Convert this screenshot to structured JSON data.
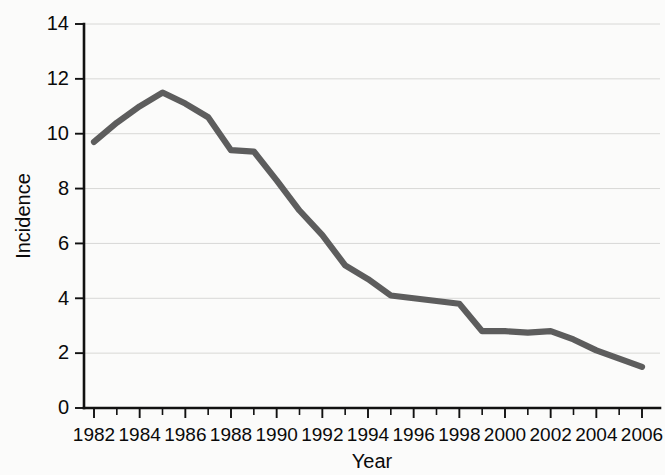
{
  "chart_data": {
    "type": "line",
    "title": "",
    "subtitle": "",
    "xlabel": "Year",
    "ylabel": "Incidence",
    "xlim": [
      1982,
      2006
    ],
    "ylim": [
      0,
      14
    ],
    "grid": true,
    "legend": "none",
    "x_tick_labels": [
      "1982",
      "1984",
      "1986",
      "1988",
      "1990",
      "1992",
      "1994",
      "1996",
      "1998",
      "2000",
      "2002",
      "2004",
      "2006"
    ],
    "x_tick_values": [
      1982,
      1984,
      1986,
      1988,
      1990,
      1992,
      1994,
      1996,
      1998,
      2000,
      2002,
      2004,
      2006
    ],
    "x_minor_tick_values": [
      1983,
      1985,
      1987,
      1989,
      1991,
      1993,
      1995,
      1997,
      1999,
      2001,
      2003,
      2005
    ],
    "y_tick_labels": [
      "0",
      "2",
      "4",
      "6",
      "8",
      "10",
      "12",
      "14"
    ],
    "y_tick_values": [
      0,
      2,
      4,
      6,
      8,
      10,
      12,
      14
    ],
    "x": [
      1982,
      1983,
      1984,
      1985,
      1986,
      1987,
      1988,
      1989,
      1990,
      1991,
      1992,
      1993,
      1994,
      1995,
      1996,
      1997,
      1998,
      1999,
      2000,
      2001,
      2002,
      2003,
      2004,
      2005,
      2006
    ],
    "values": [
      9.7,
      10.4,
      11.0,
      11.5,
      11.1,
      10.6,
      9.4,
      9.35,
      8.3,
      7.2,
      6.3,
      5.2,
      4.7,
      4.1,
      4.0,
      3.9,
      3.8,
      2.8,
      2.8,
      2.75,
      2.8,
      2.5,
      2.1,
      1.8,
      1.5
    ],
    "series": [
      {
        "name": "Incidence",
        "color": "#5d5d5d",
        "values": [
          9.7,
          10.4,
          11.0,
          11.5,
          11.1,
          10.6,
          9.4,
          9.35,
          8.3,
          7.2,
          6.3,
          5.2,
          4.7,
          4.1,
          4.0,
          3.9,
          3.8,
          2.8,
          2.8,
          2.75,
          2.8,
          2.5,
          2.1,
          1.8,
          1.5
        ]
      }
    ],
    "colors": {
      "line": "#5d5d5d",
      "axis": "#111111",
      "grid": "#d8d8d6",
      "background": "#fbfbfa",
      "text": "#0a0a0a"
    }
  }
}
